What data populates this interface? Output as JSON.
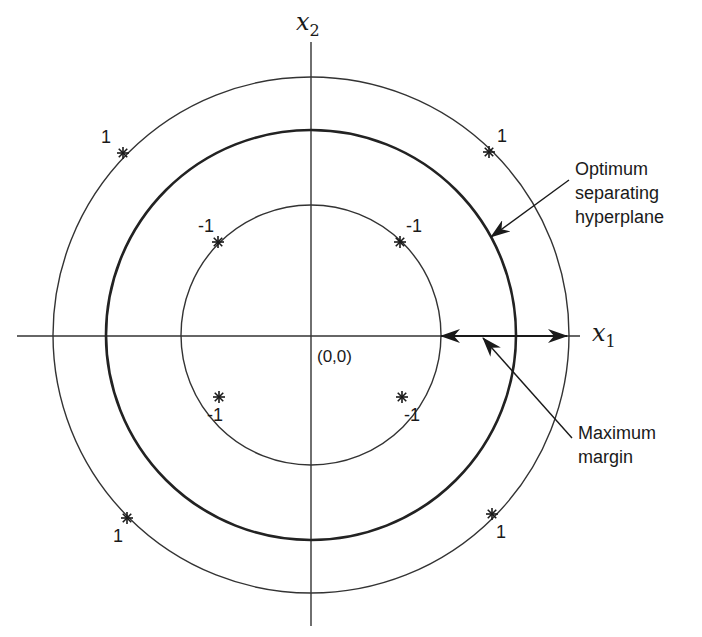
{
  "diagram": {
    "title": "",
    "origin_label": "(0,0)",
    "axes": {
      "x": {
        "label": "x",
        "subscript": "1"
      },
      "y": {
        "label": "x",
        "subscript": "2"
      }
    },
    "circles": [
      {
        "name": "outer-class-circle",
        "radius_px": 258,
        "stroke": "#333333",
        "width": 1.4
      },
      {
        "name": "optimum-separating-hyperplane",
        "radius_px": 205,
        "stroke": "#222222",
        "width": 2.6
      },
      {
        "name": "inner-class-circle",
        "radius_px": 130,
        "stroke": "#333333",
        "width": 1.4
      }
    ],
    "points": [
      {
        "class": "1",
        "label": "1",
        "x": 123,
        "y": 153,
        "label_pos": "above-left"
      },
      {
        "class": "1",
        "label": "1",
        "x": 489,
        "y": 152,
        "label_pos": "above-right"
      },
      {
        "class": "1",
        "label": "1",
        "x": 127,
        "y": 518,
        "label_pos": "below-left"
      },
      {
        "class": "1",
        "label": "1",
        "x": 492,
        "y": 514,
        "label_pos": "below-right"
      },
      {
        "class": "-1",
        "label": "-1",
        "x": 218,
        "y": 242,
        "label_pos": "above-left"
      },
      {
        "class": "-1",
        "label": "-1",
        "x": 400,
        "y": 242,
        "label_pos": "above-right"
      },
      {
        "class": "-1",
        "label": "-1",
        "x": 219,
        "y": 397,
        "label_pos": "below-left"
      },
      {
        "class": "-1",
        "label": "-1",
        "x": 402,
        "y": 397,
        "label_pos": "below-right"
      }
    ],
    "annotations": {
      "hyperplane": {
        "line1": "Optimum",
        "line2": "separating",
        "line3": "hyperplane"
      },
      "margin": {
        "line1": "Maximum",
        "line2": "margin"
      }
    },
    "colors": {
      "ink": "#1a1a1a",
      "background": "#ffffff"
    }
  }
}
